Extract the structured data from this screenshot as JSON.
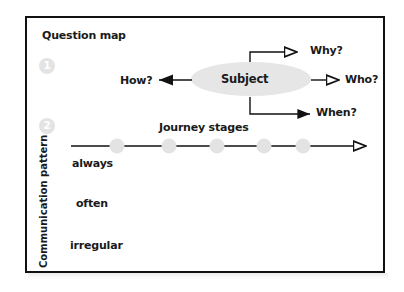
{
  "diagram": {
    "section1": {
      "title": "Question map",
      "number": "1",
      "center": "Subject",
      "branches": [
        {
          "label": "How?",
          "direction": "left"
        },
        {
          "label": "Why?",
          "direction": "up-right"
        },
        {
          "label": "Who?",
          "direction": "right"
        },
        {
          "label": "When?",
          "direction": "down-right"
        }
      ]
    },
    "section2": {
      "number": "2",
      "timeline_label": "Journey stages",
      "stage_count": 5,
      "y_axis_label": "Communication pattern",
      "rows": [
        "always",
        "often",
        "irregular"
      ]
    },
    "colors": {
      "ink": "#111111",
      "ellipse_fill": "#e6e6e6",
      "stage_dot": "#e3e3e3",
      "number_badge": "#e3e3e3"
    }
  }
}
